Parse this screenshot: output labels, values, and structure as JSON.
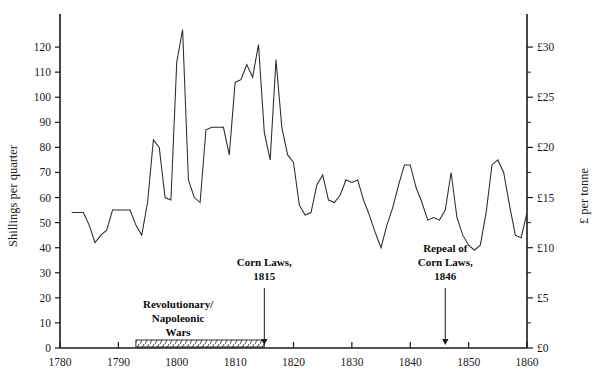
{
  "chart_data": {
    "type": "line",
    "title": "",
    "subtitle": "",
    "xlabel": "",
    "ylabel": "Shillings per quarter",
    "y2label": "£ per tonne",
    "xlim": [
      1780,
      1860
    ],
    "ylim": [
      0,
      130
    ],
    "y2lim": [
      0,
      32.5
    ],
    "grid": false,
    "legend": null,
    "x_ticks": [
      1780,
      1790,
      1800,
      1810,
      1820,
      1830,
      1840,
      1850,
      1860
    ],
    "x_tick_labels": [
      "1780",
      "1790",
      "1800",
      "1810",
      "1820",
      "1830",
      "1840",
      "1850",
      "1860"
    ],
    "x_minor_step": 5,
    "y_ticks": [
      0,
      10,
      20,
      30,
      40,
      50,
      60,
      70,
      80,
      90,
      100,
      110,
      120
    ],
    "y_tick_labels": [
      "0",
      "10",
      "20",
      "30",
      "40",
      "50",
      "60",
      "70",
      "80",
      "90",
      "100",
      "110",
      "120"
    ],
    "y2_ticks": [
      0,
      5,
      10,
      15,
      20,
      25,
      30
    ],
    "y2_tick_labels": [
      "£0",
      "£5",
      "£10",
      "£15",
      "£20",
      "£25",
      "£30"
    ],
    "y2_minor_step": 2.5,
    "series": [
      {
        "name": "Wheat price",
        "x": [
          1782,
          1783,
          1784,
          1785,
          1786,
          1787,
          1788,
          1789,
          1790,
          1791,
          1792,
          1793,
          1794,
          1795,
          1796,
          1797,
          1798,
          1799,
          1800,
          1801,
          1802,
          1803,
          1804,
          1805,
          1806,
          1807,
          1808,
          1809,
          1810,
          1811,
          1812,
          1813,
          1814,
          1815,
          1816,
          1817,
          1818,
          1819,
          1820,
          1821,
          1822,
          1823,
          1824,
          1825,
          1826,
          1827,
          1828,
          1829,
          1830,
          1831,
          1832,
          1833,
          1834,
          1835,
          1836,
          1837,
          1838,
          1839,
          1840,
          1841,
          1842,
          1843,
          1844,
          1845,
          1846,
          1847,
          1848,
          1849,
          1850,
          1851,
          1852,
          1853,
          1854,
          1855,
          1856,
          1857,
          1858,
          1859,
          1860
        ],
        "values": [
          54,
          54,
          54,
          49,
          42,
          45,
          47,
          55,
          55,
          55,
          55,
          49,
          45,
          58,
          83,
          80,
          60,
          59,
          114,
          127,
          67,
          60,
          58,
          87,
          88,
          88,
          88,
          77,
          106,
          107,
          113,
          108,
          121,
          86,
          75,
          115,
          88,
          77,
          74,
          57,
          53,
          54,
          65,
          69,
          59,
          58,
          61,
          67,
          66,
          67,
          59,
          53,
          46,
          40,
          49,
          56,
          65,
          73,
          73,
          64,
          58,
          51,
          52,
          51,
          55,
          70,
          52,
          45,
          41,
          39,
          41,
          54,
          73,
          75,
          70,
          57,
          45,
          44,
          54
        ]
      }
    ],
    "annotations": [
      {
        "id": "revolutionary-napoleonic-wars",
        "lines": [
          "Revolutionary/",
          "Napoleonic",
          "Wars"
        ],
        "type": "span-label",
        "x_start": 1793,
        "x_end": 1815
      },
      {
        "id": "corn-laws-1815",
        "lines": [
          "Corn Laws,",
          "1815"
        ],
        "type": "arrow-label",
        "x": 1815
      },
      {
        "id": "repeal-of-corn-laws-1846",
        "lines": [
          "Repeal of",
          "Corn Laws,",
          "1846"
        ],
        "type": "arrow-label",
        "x": 1846
      }
    ],
    "colors": {
      "line": "#2b2b2b",
      "axis": "#1a1a1a",
      "text": "#1a1a1a",
      "background": "#ffffff"
    }
  }
}
